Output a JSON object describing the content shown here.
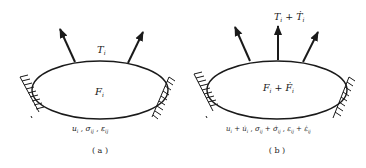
{
  "colors": {
    "stroke": "#1a1a1a",
    "background": "#ffffff"
  },
  "panel_a": {
    "traction_label": "T",
    "traction_sub": "i",
    "body_force_label": "F",
    "body_force_sub": "i",
    "field_label": "u_i , σ_ij , ε_ij",
    "field_parts": {
      "u": "u",
      "u_sub": "i",
      "sep1": " , ",
      "sigma": "σ",
      "sigma_sub": "ij",
      "sep2": " , ",
      "eps": "ε",
      "eps_sub": "ij"
    },
    "caption": "( a )"
  },
  "panel_b": {
    "traction_label": "T_i + Ṫ_i",
    "traction_parts": {
      "T": "T",
      "T_sub": "i",
      "plus": " + ",
      "Td": "Ṫ",
      "Td_sub": "i"
    },
    "body_force_label": "F_i + Ḟ_i",
    "body_force_parts": {
      "F": "F",
      "F_sub": "i",
      "plus": " + ",
      "Fd": "Ḟ",
      "Fd_sub": "i"
    },
    "field_label": "u_i + u̇_i , σ_ij + σ̇_ij , ε_ij + ε̇_ij",
    "field_parts": {
      "u": "u",
      "u_sub": "i",
      "plus1": " + ",
      "ud": "u̇",
      "ud_sub": "i",
      "sep1": " , ",
      "s": "σ",
      "s_sub": "ij",
      "plus2": " + ",
      "sd": "σ̇",
      "sd_sub": "ij",
      "sep2": " , ",
      "e": "ε",
      "e_sub": "ij",
      "plus3": " + ",
      "ed": "ε̇",
      "ed_sub": "ij"
    },
    "caption": "( b )"
  }
}
